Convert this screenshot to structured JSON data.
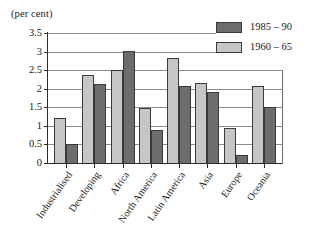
{
  "chart_data": {
    "type": "bar",
    "title": "(per cent)",
    "xlabel": "",
    "ylabel": "",
    "ylim": [
      0,
      3.5
    ],
    "yticks": [
      0,
      0.5,
      1,
      1.5,
      2,
      2.5,
      3,
      3.5
    ],
    "ytick_labels": [
      "0",
      "0.5",
      "1",
      "1.5",
      "2",
      "2.5",
      "3",
      "3.5"
    ],
    "grid": true,
    "legend_position": "top-right",
    "categories": [
      "Industrialised",
      "Developing",
      "Africa",
      "North America",
      "Latin America",
      "Asia",
      "Europe",
      "Oceania"
    ],
    "series": [
      {
        "name": "1960 – 65",
        "color": "#c6c6c6",
        "values": [
          1.22,
          2.37,
          2.5,
          1.49,
          2.82,
          2.15,
          0.93,
          2.08
        ]
      },
      {
        "name": "1985 – 90",
        "color": "#6d6d6d",
        "values": [
          0.5,
          2.12,
          3.01,
          0.88,
          2.08,
          1.92,
          0.22,
          1.52
        ]
      }
    ]
  },
  "legend": {
    "entries": [
      {
        "label": "1985 – 90",
        "swatch": "dark"
      },
      {
        "label": "1960 – 65",
        "swatch": "light"
      }
    ]
  }
}
